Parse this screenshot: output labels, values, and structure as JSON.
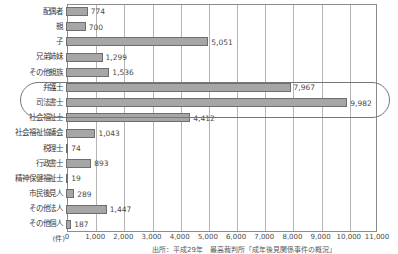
{
  "chart_data": {
    "type": "bar",
    "orientation": "horizontal",
    "title": "",
    "xlabel": "(件)",
    "ylabel": "",
    "xlim": [
      0,
      11000
    ],
    "xticks": [
      "0",
      "1,000",
      "2,000",
      "3,000",
      "4,000",
      "5,000",
      "6,000",
      "7,000",
      "8,000",
      "9,000",
      "10,000",
      "11,000"
    ],
    "grid": true,
    "legend": "none",
    "categories": [
      "配偶者",
      "親",
      "子",
      "兄弟姉妹",
      "その他親族",
      "弁護士",
      "司法書士",
      "社会福祉士",
      "社会福祉協議会",
      "税理士",
      "行政書士",
      "精神保健福祉士",
      "市民後見人",
      "その他法人",
      "その他個人"
    ],
    "values": [
      774,
      700,
      5051,
      1299,
      1536,
      7967,
      9982,
      4412,
      1043,
      74,
      893,
      19,
      289,
      1447,
      187
    ],
    "value_labels": [
      "774",
      "700",
      "5,051",
      "1,299",
      "1,536",
      "7,967",
      "9,982",
      "4,412",
      "1,043",
      "74",
      "893",
      "19",
      "289",
      "1,447",
      "187"
    ],
    "annotations": [
      {
        "kind": "oval-highlight",
        "covers": [
          "弁護士",
          "司法書士"
        ]
      }
    ],
    "colors": {
      "bar_fill": "#a6a6a6",
      "bar_stroke": "#6e6e6e",
      "grid": "#b4b4b4",
      "frame": "#8c8c8c",
      "text": "#4a4a4a"
    }
  },
  "footer": {
    "source_note": "出所：平成29年　最高裁判所「成年後見関係事件の概況」"
  }
}
